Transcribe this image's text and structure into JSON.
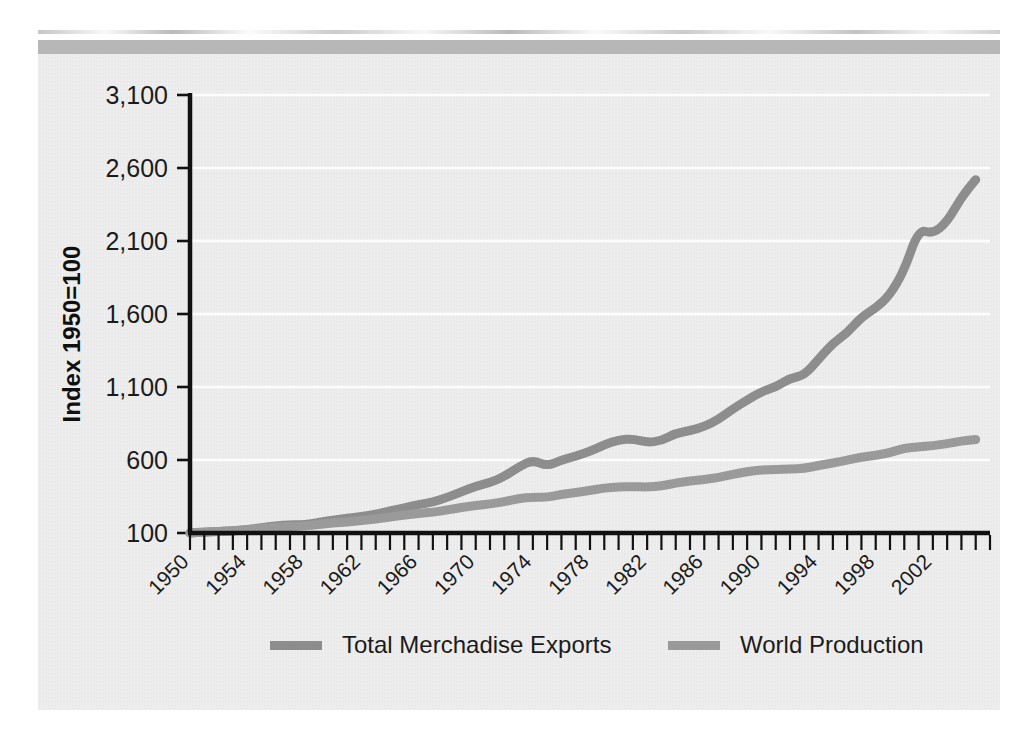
{
  "figure": {
    "background_color": "#ebebeb",
    "page_color": "#ffffff",
    "rule_color": "#b7b7b7"
  },
  "chart_data": {
    "type": "line",
    "title": "",
    "subtitle": "",
    "xlabel": "",
    "ylabel": "Index 1950=100",
    "xlim": [
      1950,
      2006
    ],
    "ylim": [
      100,
      3100
    ],
    "grid": true,
    "grid_axis": "y",
    "grid_color": "#fdfdfd",
    "legend_position": "bottom",
    "y_ticks": [
      100,
      600,
      1100,
      1600,
      2100,
      2600,
      3100
    ],
    "y_tick_labels": [
      "100",
      "600",
      "1,100",
      "1,600",
      "2,100",
      "2,600",
      "3,100"
    ],
    "x_ticks": [
      1950,
      1954,
      1958,
      1962,
      1966,
      1970,
      1974,
      1978,
      1982,
      1986,
      1990,
      1994,
      1998,
      2002
    ],
    "x_tick_labels": [
      "1950",
      "1954",
      "1958",
      "1962",
      "1966",
      "1970",
      "1974",
      "1978",
      "1982",
      "1986",
      "1990",
      "1994",
      "1998",
      "2002"
    ],
    "x_minor_tick_step": 1,
    "x_tick_label_rotation": -45,
    "x": [
      1950,
      1951,
      1952,
      1953,
      1954,
      1955,
      1956,
      1957,
      1958,
      1959,
      1960,
      1961,
      1962,
      1963,
      1964,
      1965,
      1966,
      1967,
      1968,
      1969,
      1970,
      1971,
      1972,
      1973,
      1974,
      1975,
      1976,
      1977,
      1978,
      1979,
      1980,
      1981,
      1982,
      1983,
      1984,
      1985,
      1986,
      1987,
      1988,
      1989,
      1990,
      1991,
      1992,
      1993,
      1994,
      1995,
      1996,
      1997,
      1998,
      1999,
      2000,
      2001,
      2002,
      2003,
      2004,
      2005
    ],
    "series": [
      {
        "name": "Total Merchadise Exports",
        "color": "#8d8d8d",
        "line_width": 9,
        "values": [
          100,
          108,
          110,
          114,
          124,
          136,
          150,
          158,
          156,
          172,
          190,
          200,
          212,
          228,
          252,
          272,
          296,
          310,
          344,
          382,
          420,
          446,
          486,
          552,
          600,
          558,
          600,
          626,
          660,
          704,
          738,
          746,
          720,
          732,
          784,
          800,
          830,
          878,
          950,
          1010,
          1068,
          1100,
          1160,
          1180,
          1290,
          1400,
          1470,
          1580,
          1640,
          1730,
          1900,
          2180,
          2150,
          2230,
          2400,
          2520
        ],
        "marker": "none"
      },
      {
        "name": "World Production",
        "color": "#9a9a9a",
        "line_width": 9,
        "values": [
          100,
          106,
          110,
          116,
          122,
          132,
          140,
          146,
          148,
          158,
          168,
          176,
          186,
          196,
          210,
          222,
          234,
          242,
          258,
          274,
          288,
          298,
          314,
          336,
          346,
          344,
          364,
          376,
          392,
          408,
          414,
          418,
          414,
          422,
          442,
          456,
          466,
          480,
          502,
          520,
          532,
          534,
          538,
          542,
          562,
          580,
          598,
          620,
          632,
          650,
          682,
          690,
          698,
          712,
          730,
          740
        ],
        "marker": "none"
      }
    ]
  },
  "legend": {
    "items": [
      {
        "label": "Total Merchadise Exports",
        "color": "#8d8d8d"
      },
      {
        "label": "World Production",
        "color": "#9a9a9a"
      }
    ]
  }
}
